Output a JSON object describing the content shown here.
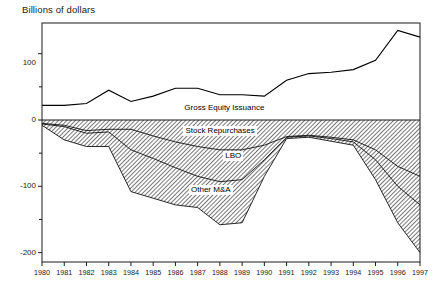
{
  "chart_data": {
    "type": "area",
    "title": "Billions of dollars",
    "xlabel": "",
    "ylabel": "Billions of dollars",
    "ylim": [
      -220,
      160
    ],
    "xlim": [
      1980,
      1997
    ],
    "grid": false,
    "legend_position": "inline-annotations",
    "x": [
      1980,
      1981,
      1982,
      1983,
      1984,
      1985,
      1986,
      1987,
      1988,
      1989,
      1990,
      1991,
      1992,
      1993,
      1994,
      1995,
      1996,
      1997
    ],
    "y_ticks": [
      100,
      0,
      -100,
      -200
    ],
    "y_tick_labels": [
      "100",
      "0",
      "-100",
      "-200"
    ],
    "x_tick_labels": [
      "1980",
      "1981",
      "1982",
      "1983",
      "1984",
      "1985",
      "1986",
      "1987",
      "1988",
      "1989",
      "1990",
      "1991",
      "1992",
      "1993",
      "1994",
      "1995",
      "1996",
      "1997"
    ],
    "series": [
      {
        "name": "Gross Equity Issuance",
        "kind": "line",
        "values": [
          22,
          22,
          25,
          45,
          28,
          36,
          48,
          48,
          38,
          38,
          36,
          60,
          70,
          72,
          76,
          90,
          135,
          125
        ]
      },
      {
        "name": "Stock Repurchases",
        "kind": "band",
        "values": [
          -5,
          -8,
          -16,
          -14,
          -14,
          -24,
          -33,
          -40,
          -45,
          -45,
          -38,
          -25,
          -23,
          -26,
          -30,
          -45,
          -70,
          -85
        ]
      },
      {
        "name": "LBO",
        "kind": "band",
        "values": [
          -6,
          -10,
          -20,
          -18,
          -45,
          -58,
          -72,
          -85,
          -93,
          -90,
          -60,
          -26,
          -24,
          -28,
          -33,
          -60,
          -100,
          -128
        ]
      },
      {
        "name": "Other M&A",
        "kind": "band",
        "values": [
          -8,
          -30,
          -40,
          -40,
          -108,
          -118,
          -128,
          -132,
          -158,
          -155,
          -85,
          -28,
          -26,
          -32,
          -38,
          -90,
          -155,
          -200
        ]
      }
    ],
    "annotations": [
      {
        "text": "Gross Equity Issuance",
        "x": 1988.2,
        "y": 18
      },
      {
        "text": "Stock Repurchases",
        "x": 1988.0,
        "y": -17
      },
      {
        "text": "LBO",
        "x": 1988.6,
        "y": -55
      },
      {
        "text": "Other M&A",
        "x": 1987.6,
        "y": -106
      }
    ],
    "colors": {
      "line": "#000000",
      "band_fill": "#b9b9b9",
      "band_edge": "#000000",
      "axis": "#1b1b1b",
      "background": "#ffffff"
    }
  }
}
